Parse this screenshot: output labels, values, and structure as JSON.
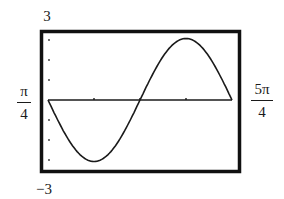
{
  "chart_data": {
    "type": "line",
    "title": "",
    "function": "y = 3cos(2x)",
    "xlabel": "",
    "ylabel": "",
    "xlim": [
      "π/4",
      "5π/4"
    ],
    "ylim": [
      -3,
      3
    ],
    "x_tick_step": "π/4",
    "y_tick_step": 1,
    "grid": false,
    "legend": null,
    "labels": {
      "ymax": "3",
      "ymin": "−3",
      "xmin_num": "π",
      "xmin_den": "4",
      "xmax_num": "5π",
      "xmax_den": "4"
    },
    "series": [
      {
        "name": "3cos(2x)",
        "x": [
          "π/4",
          "π/2",
          "3π/4",
          "π",
          "5π/4"
        ],
        "values": [
          0,
          -3,
          0,
          3,
          0
        ]
      }
    ]
  },
  "colors": {
    "frame": "#111111",
    "curve": "#1a1a1a",
    "background": "#ffffff"
  }
}
